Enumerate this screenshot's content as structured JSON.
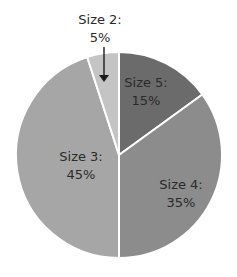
{
  "chart_data": {
    "type": "pie",
    "title": "",
    "categories": [
      "Size 5",
      "Size 4",
      "Size 3",
      "Size 2"
    ],
    "values": [
      15,
      35,
      45,
      5
    ],
    "unit": "%",
    "start_angle_deg": 0,
    "direction": "clockwise",
    "colors": [
      "#6b6b6b",
      "#8c8c8c",
      "#a6a6a6",
      "#c4c4c4"
    ],
    "separator_color": "#ffffff",
    "labels": [
      {
        "name": "Size 5:",
        "value": "15%",
        "x": 146,
        "y": 87
      },
      {
        "name": "Size 4:",
        "value": "35%",
        "x": 181,
        "y": 189
      },
      {
        "name": "Size 3:",
        "value": "45%",
        "x": 81,
        "y": 161
      },
      {
        "name": "Size 2:",
        "value": "5%",
        "x": 100,
        "y": 24,
        "callout_arrow": true
      }
    ],
    "legend": "none",
    "grid": false
  }
}
